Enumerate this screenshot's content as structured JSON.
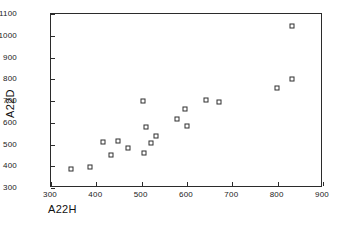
{
  "chart_data": {
    "type": "scatter",
    "title": "",
    "xlabel": "A22H",
    "ylabel": "A22D",
    "xlim": [
      300,
      900
    ],
    "ylim": [
      300,
      1100
    ],
    "xticks": [
      300,
      400,
      500,
      600,
      700,
      800,
      900
    ],
    "yticks": [
      300,
      400,
      500,
      600,
      700,
      800,
      900,
      1000,
      1100
    ],
    "grid": false,
    "legend": null,
    "marker": "open-square",
    "marker_color": "#2f2f2f",
    "frame_color": "#2b2b2b",
    "background": "#ffffff",
    "points": [
      {
        "x": 345,
        "y": 388
      },
      {
        "x": 386,
        "y": 396
      },
      {
        "x": 414,
        "y": 512
      },
      {
        "x": 433,
        "y": 450
      },
      {
        "x": 447,
        "y": 518
      },
      {
        "x": 469,
        "y": 484
      },
      {
        "x": 503,
        "y": 700
      },
      {
        "x": 505,
        "y": 461
      },
      {
        "x": 510,
        "y": 582
      },
      {
        "x": 521,
        "y": 509
      },
      {
        "x": 531,
        "y": 541
      },
      {
        "x": 578,
        "y": 616
      },
      {
        "x": 595,
        "y": 665
      },
      {
        "x": 600,
        "y": 584
      },
      {
        "x": 643,
        "y": 704
      },
      {
        "x": 670,
        "y": 697
      },
      {
        "x": 799,
        "y": 758
      },
      {
        "x": 831,
        "y": 1045
      },
      {
        "x": 831,
        "y": 800
      }
    ]
  }
}
